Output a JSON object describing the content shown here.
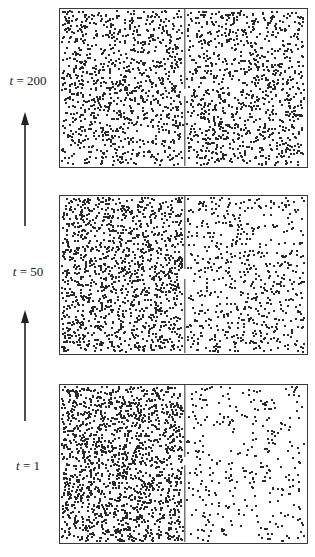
{
  "figure": {
    "panels": [
      {
        "id": "t200",
        "label_var": "t",
        "label_eq": " = 200",
        "time": 200,
        "left_count": 1050,
        "right_count": 1000,
        "top": 8,
        "partition_gaps": [
          [
            80,
            87
          ]
        ]
      },
      {
        "id": "t50",
        "label_var": "t",
        "label_eq": " = 50",
        "time": 50,
        "left_count": 1350,
        "right_count": 620,
        "top": 195,
        "partition_gaps": [
          [
            73,
            83
          ]
        ]
      },
      {
        "id": "t1",
        "label_var": "t",
        "label_eq": " = 1",
        "time": 1,
        "left_count": 1600,
        "right_count": 330,
        "top": 384,
        "partition_gaps": [
          [
            72,
            80
          ]
        ]
      }
    ],
    "arrows": [
      {
        "id": "arrow-t50-to-t200",
        "tip_y": 112,
        "tail_y": 226
      },
      {
        "id": "arrow-t1-to-t50",
        "tip_y": 310,
        "tail_y": 421
      }
    ],
    "colors": {
      "dot": "#2a2a2a",
      "border": "#3a3a3a",
      "partition": "#777777",
      "arrow": "#222222"
    }
  }
}
